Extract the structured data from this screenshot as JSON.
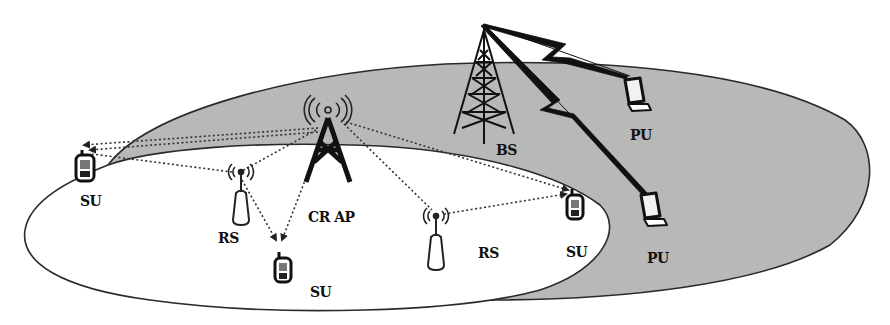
{
  "diagram": {
    "type": "cognitive-radio-network",
    "colors": {
      "background": "#ffffff",
      "primary_area_fill": "#b8b8b8",
      "secondary_area_fill": "#ffffff",
      "stroke": "#222222",
      "text": "#111111"
    },
    "nodes": {
      "bs": {
        "label": "BS",
        "kind": "base-station-tower"
      },
      "cr_ap": {
        "label": "CR AP",
        "kind": "cognitive-radio-access-point"
      },
      "rs_left": {
        "label": "RS",
        "kind": "relay-station"
      },
      "rs_right": {
        "label": "RS",
        "kind": "relay-station"
      },
      "su_left": {
        "label": "SU",
        "kind": "secondary-user"
      },
      "su_bottom": {
        "label": "SU",
        "kind": "secondary-user"
      },
      "su_right": {
        "label": "SU",
        "kind": "secondary-user"
      },
      "pu_top": {
        "label": "PU",
        "kind": "primary-user"
      },
      "pu_bottom": {
        "label": "PU",
        "kind": "primary-user"
      }
    },
    "regions": [
      {
        "name": "primary-network-coverage",
        "fill": "shaded gray"
      },
      {
        "name": "secondary-network-coverage",
        "fill": "white"
      }
    ],
    "links": [
      {
        "from": "BS",
        "to": "PU (top)",
        "style": "lightning"
      },
      {
        "from": "BS",
        "to": "PU (bottom)",
        "style": "lightning"
      },
      {
        "from": "CR AP",
        "to": "SU (left)",
        "style": "dotted-arrow"
      },
      {
        "from": "CR AP",
        "to": "RS (left)",
        "style": "dotted"
      },
      {
        "from": "RS (left)",
        "to": "SU (left)",
        "style": "dotted-arrow"
      },
      {
        "from": "RS (left)",
        "to": "SU (bottom)",
        "style": "dotted-arrow"
      },
      {
        "from": "CR AP",
        "to": "SU (bottom)",
        "style": "dotted-arrow"
      },
      {
        "from": "CR AP",
        "to": "RS (right)",
        "style": "dotted"
      },
      {
        "from": "CR AP",
        "to": "SU (right)",
        "style": "dotted-arrow"
      },
      {
        "from": "RS (right)",
        "to": "SU (right)",
        "style": "dotted-arrow"
      }
    ]
  }
}
